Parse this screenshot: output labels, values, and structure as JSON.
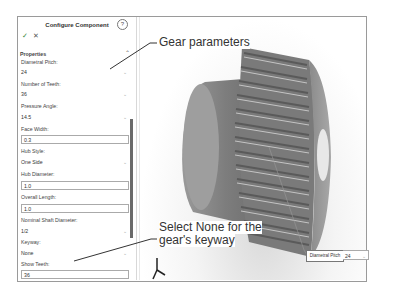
{
  "panel": {
    "title": "Configure Component",
    "help_icon": "?",
    "ok_icon": "✓",
    "cancel_icon": "✕",
    "section": "Properties",
    "fields": [
      {
        "label": "Diametral Pitch:",
        "value": "24",
        "type": "select"
      },
      {
        "label": "Number of Teeth:",
        "value": "36",
        "type": "select"
      },
      {
        "label": "Pressure Angle:",
        "value": "14.5",
        "type": "select"
      },
      {
        "label": "Face Width:",
        "value": "0.3",
        "type": "input"
      },
      {
        "label": "Hub Style:",
        "value": "One Side",
        "type": "select"
      },
      {
        "label": "Hub Diameter:",
        "value": "1.0",
        "type": "input"
      },
      {
        "label": "Overall Length:",
        "value": "1.0",
        "type": "input"
      },
      {
        "label": "Nominal Shaft Diameter:",
        "value": "1/2",
        "type": "select"
      },
      {
        "label": "Keyway:",
        "value": "None",
        "type": "select"
      },
      {
        "label": "Show Teeth:",
        "value": "36",
        "type": "input"
      }
    ]
  },
  "callouts": {
    "top": "Gear parameters",
    "bottom_line1": "Select None for the",
    "bottom_line2": "gear's keyway"
  },
  "viewport_label": {
    "name": "Diametral Pitch",
    "value": "24"
  },
  "colors": {
    "accent_check": "#3a8a3a",
    "scrollbar": "#6a6a6a",
    "gear": "#8c8c8c"
  }
}
